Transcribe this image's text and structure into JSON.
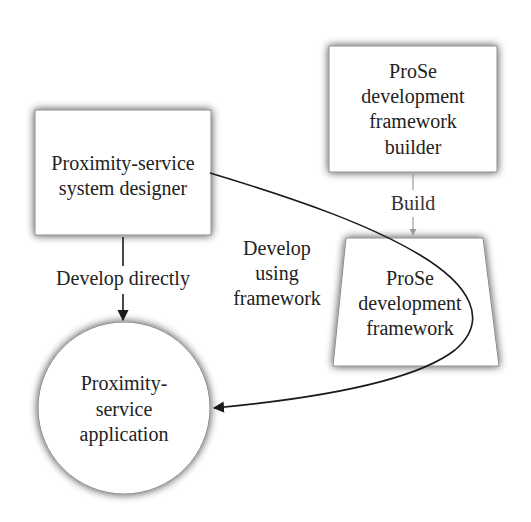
{
  "diagram": {
    "type": "flow",
    "nodes": [
      {
        "id": "designer",
        "shape": "rectangle",
        "lines": [
          "Proximity-service",
          "system designer"
        ]
      },
      {
        "id": "builder",
        "shape": "rectangle",
        "lines": [
          "ProSe",
          "development",
          "framework",
          "builder"
        ]
      },
      {
        "id": "framework",
        "shape": "trapezoid",
        "lines": [
          "ProSe",
          "development",
          "framework"
        ]
      },
      {
        "id": "application",
        "shape": "circle",
        "lines": [
          "Proximity-",
          "service",
          "application"
        ]
      }
    ],
    "edges": [
      {
        "id": "build",
        "from": "builder",
        "to": "framework",
        "style": "gray",
        "label_lines": [
          "Build"
        ]
      },
      {
        "id": "develop-directly",
        "from": "designer",
        "to": "application",
        "style": "black",
        "label_lines": [
          "Develop directly"
        ]
      },
      {
        "id": "develop-using-framework",
        "from": "designer",
        "to": "application",
        "via": "framework",
        "style": "black-curve",
        "label_lines": [
          "Develop",
          "using",
          "framework"
        ]
      }
    ],
    "colors": {
      "stroke": "#1a1a1a",
      "build_arrow": "#9a9a9a",
      "shadow": "#7a7a7a",
      "fill": "#ffffff",
      "text": "#222222"
    }
  }
}
